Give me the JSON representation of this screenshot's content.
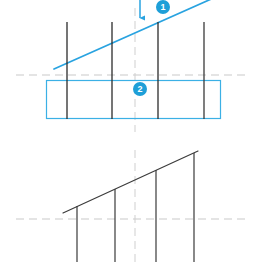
{
  "figure": {
    "width": 260,
    "height": 267,
    "background_color": "#ffffff",
    "colors": {
      "accent_blue": "#29a3e0",
      "badge_blue": "#1e9fd8",
      "line_dark": "#2b2b2b",
      "axis_gray": "#c8c8c8",
      "rectangle_stroke": "#3bb0e5"
    },
    "callouts": [
      {
        "id": "badge-1",
        "label": "1",
        "x": 156,
        "y": 0
      },
      {
        "id": "badge-2",
        "label": "2",
        "x": 133,
        "y": 82
      }
    ]
  },
  "panels": [
    {
      "name": "upper-panel",
      "axis_horizontal_y": 75,
      "axis_vertical_x": 135,
      "diagonal": {
        "x1": 54,
        "y1": 69,
        "x2": 216,
        "y2": -3,
        "color": "#29a3e0",
        "width": 1.6
      },
      "arrow": {
        "x": 140,
        "y_start": 0,
        "y_end": 23,
        "color": "#29a3e0"
      },
      "rectangle": {
        "x": 46,
        "y": 80,
        "width": 175,
        "height": 39,
        "stroke": "#3bb0e5"
      },
      "verticals": [
        {
          "x": 67,
          "y_top": 22,
          "y_bottom": 119
        },
        {
          "x": 112,
          "y_top": 22,
          "y_bottom": 119
        },
        {
          "x": 158,
          "y_top": 22,
          "y_bottom": 119
        },
        {
          "x": 204,
          "y_top": 22,
          "y_bottom": 119
        }
      ]
    },
    {
      "name": "lower-panel",
      "axis_horizontal_y": 219,
      "axis_vertical_x": 135,
      "diagonal": {
        "x1": 63,
        "y1": 213,
        "x2": 197,
        "y2": 152,
        "color": "#3c3c3c",
        "width": 1.2
      },
      "verticals": [
        {
          "x": 77,
          "y_top": 206,
          "y_bottom": 262
        },
        {
          "x": 115,
          "y_top": 189,
          "y_bottom": 262
        },
        {
          "x": 156,
          "y_top": 170,
          "y_bottom": 262
        },
        {
          "x": 194,
          "y_top": 153,
          "y_bottom": 262
        }
      ]
    }
  ]
}
